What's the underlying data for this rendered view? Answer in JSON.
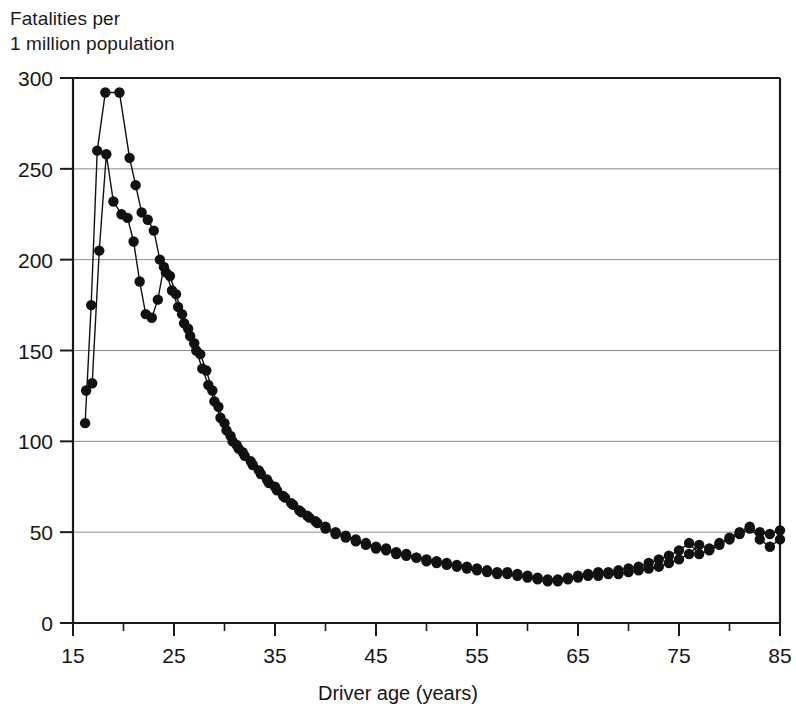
{
  "figure": {
    "y_axis_title_line1": "Fatalities per",
    "y_axis_title_line2": "1 million population"
  },
  "chart_data": {
    "type": "scatter",
    "title": "",
    "subtitle": "",
    "xlabel": "Driver age (years)",
    "ylabel": "Fatalities per 1 million population",
    "xlim": [
      15,
      85
    ],
    "ylim": [
      0,
      300
    ],
    "xticks": [
      15,
      25,
      35,
      45,
      55,
      65,
      75,
      85
    ],
    "xticks_minor": [
      20,
      30,
      40,
      50,
      60,
      70,
      80
    ],
    "yticks": [
      0,
      50,
      100,
      150,
      200,
      250,
      300
    ],
    "grid": "horizontal",
    "legend": "none",
    "marker": "filled-circle",
    "line": "connected",
    "color": "#111111",
    "series": [
      {
        "name": "series-1",
        "x": [
          16.2,
          16.8,
          17.4,
          18.2,
          19.6,
          20.6,
          21.2,
          21.8,
          22.4,
          23.0,
          23.6,
          24.2,
          24.8,
          25.4,
          26.0,
          26.6,
          27.2,
          27.8,
          28.4,
          29.0,
          29.6,
          30.2,
          30.8,
          31.4,
          32.0,
          32.8,
          33.6,
          34.4,
          35.2,
          36.0,
          36.8,
          37.6,
          38.4,
          39.2,
          40.0,
          41.0,
          42.0,
          43.0,
          44.0,
          45.0,
          46.0,
          47.0,
          48.0,
          49.0,
          50.0,
          51.0,
          52.0,
          53.0,
          54.0,
          55.0,
          56.0,
          57.0,
          58.0,
          59.0,
          60.0,
          61.0,
          62.0,
          63.0,
          64.0,
          65.0,
          66.0,
          67.0,
          68.0,
          69.0,
          70.0,
          71.0,
          72.0,
          73.0,
          74.0,
          75.0,
          76.0,
          77.0,
          78.0,
          79.0,
          80.0,
          81.0,
          82.0,
          83.0,
          84.0,
          85.0
        ],
        "y": [
          110,
          175,
          260,
          292,
          292,
          256,
          241,
          226,
          222,
          216,
          200,
          193,
          183,
          174,
          165,
          158,
          150,
          140,
          131,
          122,
          113,
          106,
          100,
          96,
          92,
          87,
          82,
          77,
          73,
          69,
          65,
          61,
          58,
          55,
          52,
          49,
          47,
          45,
          43,
          41,
          40,
          38,
          37,
          36,
          34,
          33,
          32,
          31,
          30,
          29,
          28,
          27,
          27,
          26,
          25,
          24,
          23,
          23,
          24,
          25,
          26,
          26,
          27,
          27,
          28,
          29,
          30,
          31,
          33,
          35,
          38,
          43,
          41,
          44,
          46,
          49,
          52,
          50,
          49,
          51
        ]
      },
      {
        "name": "series-2",
        "x": [
          16.3,
          16.9,
          17.6,
          18.3,
          19.0,
          19.8,
          20.4,
          21.0,
          21.6,
          22.2,
          22.8,
          23.4,
          24.0,
          24.6,
          25.2,
          25.8,
          26.4,
          27.0,
          27.6,
          28.2,
          28.8,
          29.4,
          30.0,
          30.6,
          31.2,
          31.8,
          32.6,
          33.4,
          34.2,
          35.0,
          35.8,
          36.6,
          37.4,
          38.2,
          39.0,
          40.0,
          41.0,
          42.0,
          43.0,
          44.0,
          45.0,
          46.0,
          47.0,
          48.0,
          49.0,
          50.0,
          51.0,
          52.0,
          53.0,
          54.0,
          55.0,
          56.0,
          57.0,
          58.0,
          59.0,
          60.0,
          61.0,
          62.0,
          63.0,
          64.0,
          65.0,
          66.0,
          67.0,
          68.0,
          69.0,
          70.0,
          71.0,
          72.0,
          73.0,
          74.0,
          75.0,
          76.0,
          77.0,
          78.0,
          79.0,
          80.0,
          81.0,
          82.0,
          83.0,
          84.0,
          85.0
        ],
        "y": [
          128,
          132,
          205,
          258,
          232,
          225,
          223,
          210,
          188,
          170,
          168,
          178,
          196,
          191,
          181,
          170,
          162,
          154,
          148,
          139,
          128,
          119,
          110,
          103,
          98,
          94,
          89,
          84,
          79,
          75,
          70,
          66,
          62,
          59,
          56,
          53,
          50,
          48,
          46,
          44,
          42,
          41,
          39,
          38,
          36,
          35,
          34,
          33,
          32,
          31,
          30,
          29,
          28,
          28,
          27,
          26,
          25,
          24,
          24,
          25,
          26,
          27,
          28,
          28,
          29,
          30,
          31,
          33,
          35,
          37,
          40,
          44,
          38,
          40,
          43,
          47,
          50,
          53,
          46,
          42,
          46
        ]
      }
    ]
  }
}
